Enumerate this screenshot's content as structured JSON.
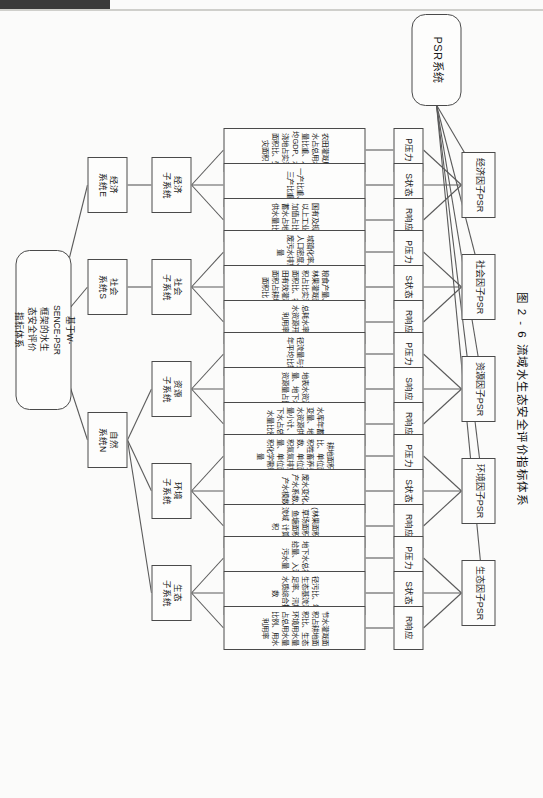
{
  "figure": {
    "caption": "图 2 - 6  流域水生态安全评价指标体系",
    "root": {
      "label": "PSR系统"
    },
    "framework": {
      "label": "基于W-\nSENCE-PSR\n框架的水生\n态安全评价\n指标体系"
    },
    "factors": [
      {
        "key": "economy",
        "label": "经济因子PSR"
      },
      {
        "key": "society",
        "label": "社会因子PSR"
      },
      {
        "key": "resource",
        "label": "资源因子PSR"
      },
      {
        "key": "environment",
        "label": "环境因子PSR"
      },
      {
        "key": "ecology",
        "label": "生态因子PSR"
      }
    ],
    "psr_nodes": [
      {
        "factor": "economy",
        "code": "P压力",
        "indicator": "农田灌溉用水占总用水量比重、人均GDP、水浇地占实灌面积比、受灾面积"
      },
      {
        "factor": "economy",
        "code": "S状态",
        "indicator": "一产比重、三产比重"
      },
      {
        "factor": "economy",
        "code": "R响应",
        "indicator": "国有及规模以上工业增加值占比、蓄水占地表供水量比例"
      },
      {
        "factor": "society",
        "code": "P压力",
        "indicator": "城镇化率、人口密度、废污水排放量"
      },
      {
        "factor": "society",
        "code": "S状态",
        "indicator": "粮食产量、林果灌溉面积占比实灌面积比、农田有效灌溉面积占耕地面积比"
      },
      {
        "factor": "society",
        "code": "R响应",
        "indicator": "总耗水率、水资源开发利用率"
      },
      {
        "factor": "resource",
        "code": "P压力",
        "indicator": "径流量与多年平均比较"
      },
      {
        "factor": "resource",
        "code": "S响应",
        "indicator": "地表水资源量、地下水资源量占比"
      },
      {
        "factor": "resource",
        "code": "R响应",
        "indicator": "水库年蓄水变量、地表水资源供应量小计、地下水占总供水量比例"
      },
      {
        "factor": "environment",
        "code": "P压力",
        "indicator": "耕地面积比、单位面积牲畜养头数、单位面积氮氮排放量、单位面积化学需氧量"
      },
      {
        "factor": "environment",
        "code": "S状态",
        "indicator": "废水变化、产水系数、产水模数"
      },
      {
        "factor": "environment",
        "code": "R响应",
        "indicator": "(林果面积、草场面积、鱼塘面积)/流域\n计算面积"
      },
      {
        "factor": "ecology",
        "code": "P压力",
        "indicator": "地下水总补给量、入河污水量"
      },
      {
        "factor": "ecology",
        "code": "S状态",
        "indicator": "径污比、年生态基流满足率、汛期水质综合指数"
      },
      {
        "factor": "ecology",
        "code": "R响应",
        "indicator": "节水灌溉面积占耕地面积比、生态环境用水量\n占总用水量比例、用水利用率"
      }
    ],
    "subsystems": [
      {
        "key": "economy",
        "label": "经济\n子系统"
      },
      {
        "key": "society",
        "label": "社会\n子系统"
      },
      {
        "key": "resource",
        "label": "资源\n子系统"
      },
      {
        "key": "environment",
        "label": "环境\n子系统"
      },
      {
        "key": "ecology",
        "label": "生态\n子系统"
      }
    ],
    "system_labels": [
      {
        "key": "economy",
        "label": "经济\n系统E"
      },
      {
        "key": "society",
        "label": "社会\n系统S"
      },
      {
        "key": "nature",
        "label": "自然\n系统N"
      }
    ]
  },
  "colors": {
    "stroke": "#4a4a4a",
    "paper": "#fbfbfa",
    "text": "#1a1a1a"
  }
}
